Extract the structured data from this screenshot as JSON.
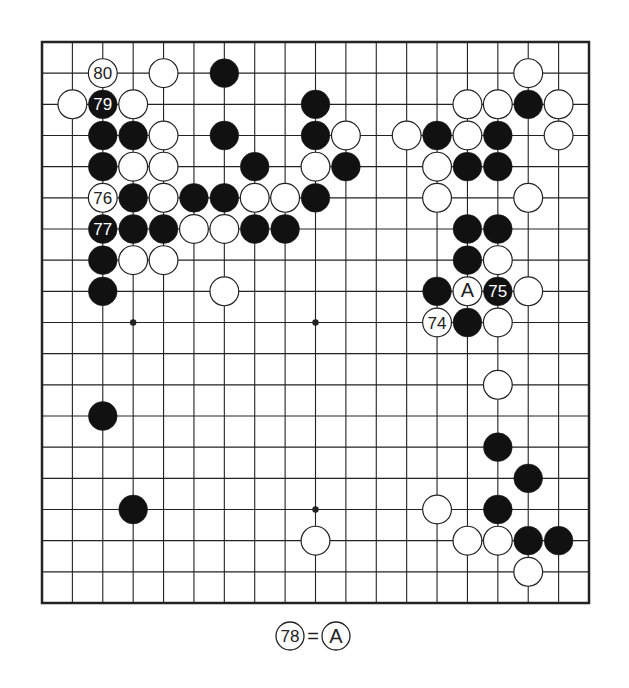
{
  "diagram": {
    "type": "go-board",
    "size": 19,
    "colors": {
      "black": "#111111",
      "white": "#ffffff",
      "line": "#222222",
      "background": "#ffffff"
    },
    "hoshi": [
      [
        4,
        4
      ],
      [
        10,
        4
      ],
      [
        16,
        4
      ],
      [
        4,
        10
      ],
      [
        10,
        10
      ],
      [
        16,
        10
      ],
      [
        4,
        16
      ],
      [
        10,
        16
      ],
      [
        16,
        16
      ]
    ],
    "stones": [
      {
        "c": 3,
        "r": 2,
        "color": "white",
        "label": "80"
      },
      {
        "c": 5,
        "r": 2,
        "color": "white"
      },
      {
        "c": 7,
        "r": 2,
        "color": "black"
      },
      {
        "c": 17,
        "r": 2,
        "color": "white"
      },
      {
        "c": 2,
        "r": 3,
        "color": "white"
      },
      {
        "c": 3,
        "r": 3,
        "color": "black",
        "label": "79"
      },
      {
        "c": 4,
        "r": 3,
        "color": "white"
      },
      {
        "c": 10,
        "r": 3,
        "color": "black"
      },
      {
        "c": 15,
        "r": 3,
        "color": "white"
      },
      {
        "c": 16,
        "r": 3,
        "color": "white"
      },
      {
        "c": 17,
        "r": 3,
        "color": "black"
      },
      {
        "c": 18,
        "r": 3,
        "color": "white"
      },
      {
        "c": 3,
        "r": 4,
        "color": "black"
      },
      {
        "c": 4,
        "r": 4,
        "color": "black"
      },
      {
        "c": 5,
        "r": 4,
        "color": "white"
      },
      {
        "c": 7,
        "r": 4,
        "color": "black"
      },
      {
        "c": 10,
        "r": 4,
        "color": "black"
      },
      {
        "c": 11,
        "r": 4,
        "color": "white"
      },
      {
        "c": 13,
        "r": 4,
        "color": "white"
      },
      {
        "c": 14,
        "r": 4,
        "color": "black"
      },
      {
        "c": 15,
        "r": 4,
        "color": "white"
      },
      {
        "c": 16,
        "r": 4,
        "color": "black"
      },
      {
        "c": 18,
        "r": 4,
        "color": "white"
      },
      {
        "c": 3,
        "r": 5,
        "color": "black"
      },
      {
        "c": 4,
        "r": 5,
        "color": "white"
      },
      {
        "c": 5,
        "r": 5,
        "color": "white"
      },
      {
        "c": 8,
        "r": 5,
        "color": "black"
      },
      {
        "c": 10,
        "r": 5,
        "color": "white"
      },
      {
        "c": 11,
        "r": 5,
        "color": "black"
      },
      {
        "c": 14,
        "r": 5,
        "color": "white"
      },
      {
        "c": 15,
        "r": 5,
        "color": "black"
      },
      {
        "c": 16,
        "r": 5,
        "color": "black"
      },
      {
        "c": 3,
        "r": 6,
        "color": "white",
        "label": "76"
      },
      {
        "c": 4,
        "r": 6,
        "color": "black"
      },
      {
        "c": 5,
        "r": 6,
        "color": "white"
      },
      {
        "c": 6,
        "r": 6,
        "color": "black"
      },
      {
        "c": 7,
        "r": 6,
        "color": "black"
      },
      {
        "c": 8,
        "r": 6,
        "color": "white"
      },
      {
        "c": 9,
        "r": 6,
        "color": "white"
      },
      {
        "c": 10,
        "r": 6,
        "color": "black"
      },
      {
        "c": 14,
        "r": 6,
        "color": "white"
      },
      {
        "c": 17,
        "r": 6,
        "color": "white"
      },
      {
        "c": 3,
        "r": 7,
        "color": "black",
        "label": "77"
      },
      {
        "c": 4,
        "r": 7,
        "color": "black"
      },
      {
        "c": 5,
        "r": 7,
        "color": "black"
      },
      {
        "c": 6,
        "r": 7,
        "color": "white"
      },
      {
        "c": 7,
        "r": 7,
        "color": "white"
      },
      {
        "c": 8,
        "r": 7,
        "color": "black"
      },
      {
        "c": 9,
        "r": 7,
        "color": "black"
      },
      {
        "c": 15,
        "r": 7,
        "color": "black"
      },
      {
        "c": 16,
        "r": 7,
        "color": "black"
      },
      {
        "c": 3,
        "r": 8,
        "color": "black"
      },
      {
        "c": 4,
        "r": 8,
        "color": "white"
      },
      {
        "c": 5,
        "r": 8,
        "color": "white"
      },
      {
        "c": 15,
        "r": 8,
        "color": "black"
      },
      {
        "c": 16,
        "r": 8,
        "color": "white"
      },
      {
        "c": 3,
        "r": 9,
        "color": "black"
      },
      {
        "c": 7,
        "r": 9,
        "color": "white"
      },
      {
        "c": 14,
        "r": 9,
        "color": "black"
      },
      {
        "c": 15,
        "r": 9,
        "color": "white",
        "label": "A"
      },
      {
        "c": 16,
        "r": 9,
        "color": "black",
        "label": "75"
      },
      {
        "c": 17,
        "r": 9,
        "color": "white"
      },
      {
        "c": 14,
        "r": 10,
        "color": "white",
        "label": "74"
      },
      {
        "c": 15,
        "r": 10,
        "color": "black"
      },
      {
        "c": 16,
        "r": 10,
        "color": "white"
      },
      {
        "c": 16,
        "r": 12,
        "color": "white"
      },
      {
        "c": 3,
        "r": 13,
        "color": "black"
      },
      {
        "c": 16,
        "r": 14,
        "color": "black"
      },
      {
        "c": 17,
        "r": 15,
        "color": "black"
      },
      {
        "c": 4,
        "r": 16,
        "color": "black"
      },
      {
        "c": 14,
        "r": 16,
        "color": "white"
      },
      {
        "c": 16,
        "r": 16,
        "color": "black"
      },
      {
        "c": 10,
        "r": 17,
        "color": "white"
      },
      {
        "c": 15,
        "r": 17,
        "color": "white"
      },
      {
        "c": 16,
        "r": 17,
        "color": "white"
      },
      {
        "c": 17,
        "r": 17,
        "color": "black"
      },
      {
        "c": 18,
        "r": 17,
        "color": "black"
      },
      {
        "c": 17,
        "r": 18,
        "color": "white"
      }
    ]
  },
  "caption": {
    "move_label": "78",
    "equals": "=",
    "target_label": "A"
  }
}
